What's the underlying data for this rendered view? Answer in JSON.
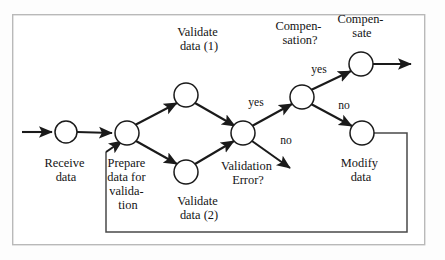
{
  "diagram": {
    "type": "flowchart",
    "canvas": {
      "width": 445,
      "height": 260
    },
    "frame": {
      "x": 12,
      "y": 14,
      "width": 413,
      "height": 231,
      "stroke": "#b9b9b9"
    },
    "colors": {
      "node_stroke": "#1a1a1a",
      "node_fill": "#ffffff",
      "edge": "#1a1a1a",
      "loop_edge": "#4a4a4a",
      "text": "#141414",
      "background": "#fdfdfd"
    },
    "nodes": [
      {
        "id": "receive",
        "cx": 66,
        "cy": 132,
        "r": 11,
        "label_lines": [
          "Receive",
          "data"
        ],
        "label_x": 66,
        "label_y": 164
      },
      {
        "id": "prepare",
        "cx": 127,
        "cy": 133,
        "r": 12,
        "label_lines": [
          "Prepare",
          "data for",
          "valida-",
          "tion"
        ],
        "label_x": 128,
        "label_y": 164
      },
      {
        "id": "validate1",
        "cx": 186,
        "cy": 95,
        "r": 12,
        "label_lines": [
          "Validate",
          "data (1)"
        ],
        "label_x": 199,
        "label_y": 33
      },
      {
        "id": "validate2",
        "cx": 186,
        "cy": 172,
        "r": 12,
        "label_lines": [
          "Validate",
          "data (2)"
        ],
        "label_x": 199,
        "label_y": 202
      },
      {
        "id": "validation_error",
        "cx": 243,
        "cy": 133,
        "r": 12,
        "label_lines": [
          "Validation",
          "Error?"
        ],
        "label_x": 248,
        "label_y": 167
      },
      {
        "id": "compensation",
        "cx": 302,
        "cy": 97,
        "r": 12,
        "label_lines": [
          "Compen-",
          "sation?"
        ],
        "label_x": 300,
        "label_y": 27
      },
      {
        "id": "compensate",
        "cx": 361,
        "cy": 64,
        "r": 12,
        "label_lines": [
          "Compen-",
          "sate"
        ],
        "label_x": 362,
        "label_y": 20
      },
      {
        "id": "modify",
        "cx": 362,
        "cy": 133,
        "r": 12,
        "label_lines": [
          "Modify",
          "data"
        ],
        "label_x": 361,
        "label_y": 164
      }
    ],
    "edge_labels": [
      {
        "id": "ve-yes",
        "text": "yes",
        "x": 256,
        "y": 103
      },
      {
        "id": "ve-no",
        "text": "no",
        "x": 286,
        "y": 141
      },
      {
        "id": "cp-yes",
        "text": "yes",
        "x": 319,
        "y": 70
      },
      {
        "id": "cp-no",
        "text": "no",
        "x": 344,
        "y": 106
      }
    ],
    "edges": [
      {
        "id": "entry-to-receive",
        "from": "entry",
        "to": "receive"
      },
      {
        "id": "receive-to-prepare",
        "from": "receive",
        "to": "prepare"
      },
      {
        "id": "prepare-to-validate1",
        "from": "prepare",
        "to": "validate1"
      },
      {
        "id": "prepare-to-validate2",
        "from": "prepare",
        "to": "validate2"
      },
      {
        "id": "validate1-to-error",
        "from": "validate1",
        "to": "validation_error"
      },
      {
        "id": "validate2-to-error",
        "from": "validate2",
        "to": "validation_error"
      },
      {
        "id": "error-yes-to-compensation",
        "from": "validation_error",
        "to": "compensation",
        "label": "yes"
      },
      {
        "id": "error-no-to-exit",
        "from": "validation_error",
        "to": "exit-down",
        "label": "no"
      },
      {
        "id": "compensation-yes-to-compensate",
        "from": "compensation",
        "to": "compensate",
        "label": "yes"
      },
      {
        "id": "compensation-no-to-modify",
        "from": "compensation",
        "to": "modify",
        "label": "no"
      },
      {
        "id": "compensate-to-exit",
        "from": "compensate",
        "to": "exit"
      },
      {
        "id": "modify-feedback-to-prepare",
        "from": "modify",
        "to": "prepare"
      }
    ]
  }
}
